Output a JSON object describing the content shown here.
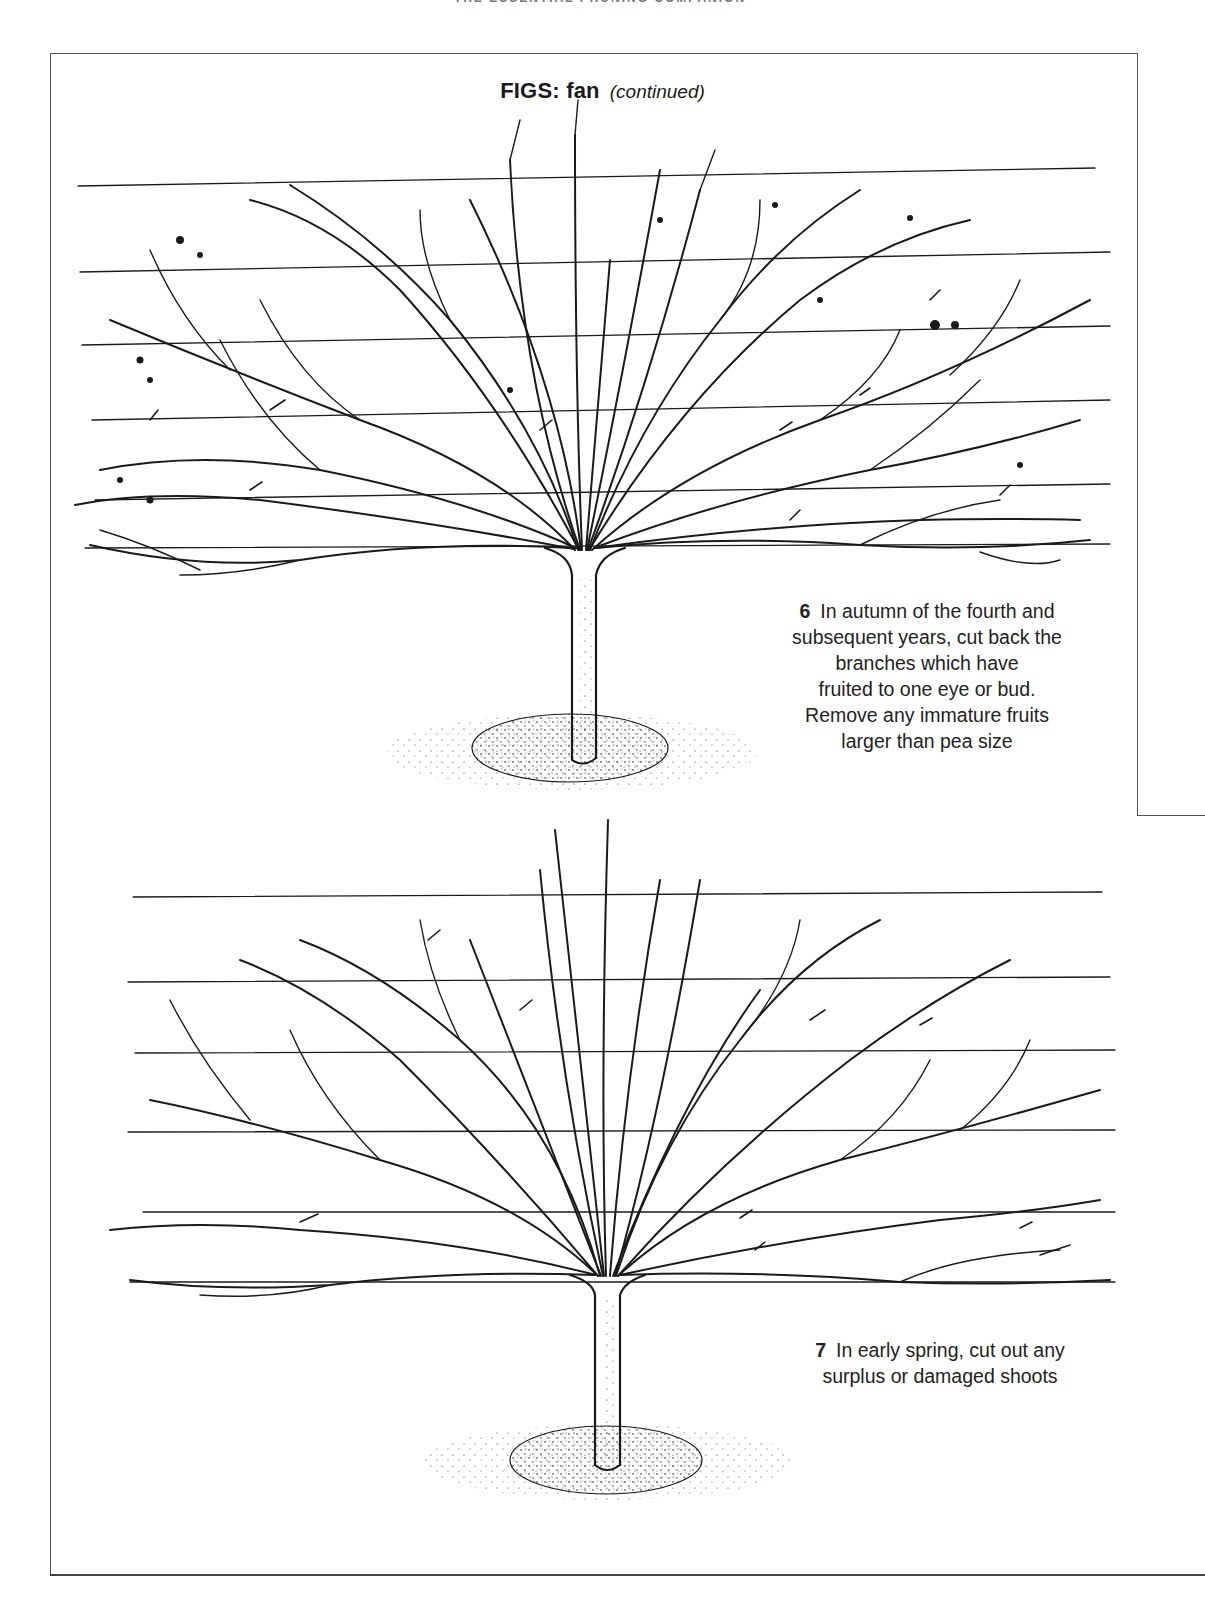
{
  "page": {
    "running_head": "THE ESSENTIAL PRUNING COMPANION",
    "title": {
      "main": "FIGS: fan",
      "sub": "(continued)"
    }
  },
  "steps": [
    {
      "number": "6",
      "text_lines": [
        "In autumn of the fourth and",
        "subsequent years, cut back the",
        "branches which have",
        "fruited to one eye or bud.",
        "Remove any immature fruits",
        "larger than pea size"
      ],
      "illustration": "fan-trained fig tree on horizontal wires, autumn pruning with cut marks and small fruits"
    },
    {
      "number": "7",
      "text_lines": [
        "In early spring, cut out any",
        "surplus or damaged shoots"
      ],
      "illustration": "fan-trained fig tree on horizontal wires, spring pruning with cut marks"
    }
  ],
  "colors": {
    "ink": "#1a1a1a",
    "frame": "#555555",
    "paper": "#ffffff"
  }
}
